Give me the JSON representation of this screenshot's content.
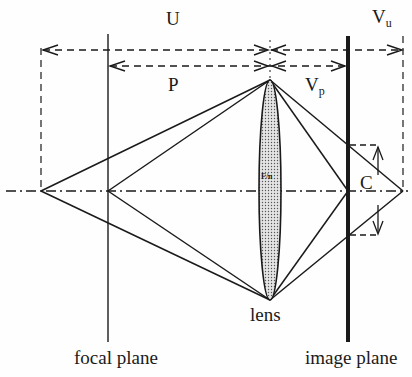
{
  "diagram": {
    "title": "",
    "labels": {
      "U": "U",
      "P": "P",
      "V_p_main": "V",
      "V_p_sub": "p",
      "V_u_main": "V",
      "V_u_sub": "u",
      "C": "C",
      "lens_aperture": "F/n",
      "lens": "lens",
      "focal_plane": "focal plane",
      "image_plane": "image plane"
    },
    "colors": {
      "ink": "#1a1a1a",
      "lens_fill": "#c8c8c8",
      "background": "#fefefe"
    }
  }
}
